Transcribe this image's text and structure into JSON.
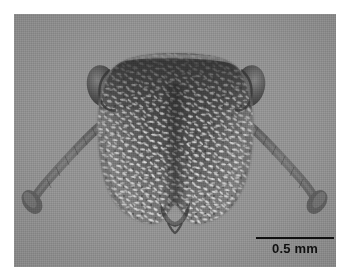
{
  "figure": {
    "modality": "grayscale-micrograph",
    "background_color": "#919191",
    "page_color": "#ffffff",
    "plate": {
      "x": 14,
      "y": 14,
      "width": 322,
      "height": 253
    }
  },
  "scale_bar": {
    "label": "0.5 mm",
    "value": 0.5,
    "unit": "mm",
    "line_color": "#101010",
    "text_color": "#101010",
    "bar_length_px": 78,
    "position": {
      "x": 255,
      "y": 239
    }
  },
  "specimen": {
    "name": "ant-head",
    "parts": [
      {
        "name": "head-capsule",
        "label": "head capsule"
      },
      {
        "name": "vertex",
        "label": "vertex"
      },
      {
        "name": "compound-eye-left",
        "label": "left compound eye"
      },
      {
        "name": "compound-eye-right",
        "label": "right compound eye"
      },
      {
        "name": "antenna-left",
        "label": "left antenna"
      },
      {
        "name": "antenna-right",
        "label": "right antenna"
      },
      {
        "name": "antennal-club-left",
        "label": "left antennal club"
      },
      {
        "name": "antennal-club-right",
        "label": "right antennal club"
      },
      {
        "name": "clypeus",
        "label": "clypeus"
      },
      {
        "name": "mandibles",
        "label": "mandibles"
      },
      {
        "name": "setae",
        "label": "appressed setae"
      }
    ],
    "colors": {
      "cuticle_dark": "#3c3c3c",
      "cuticle_mid": "#6a6a6a",
      "cuticle_light": "#9e9e9e",
      "setae": "#e8e8e8",
      "eye": "#4a4a4a",
      "antenna": "#6d6d6d"
    }
  }
}
